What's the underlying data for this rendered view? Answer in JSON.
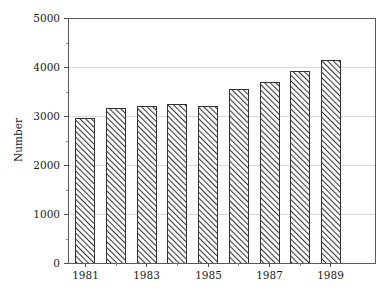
{
  "chart_data": {
    "type": "bar",
    "title": "",
    "xlabel": "",
    "ylabel": "Number",
    "categories": [
      "1981",
      "1982",
      "1983",
      "1984",
      "1985",
      "1986",
      "1987",
      "1988",
      "1989"
    ],
    "values": [
      2960,
      3155,
      3210,
      3245,
      3200,
      3545,
      3700,
      3920,
      4150
    ],
    "series": [
      {
        "name": "Number",
        "values": [
          2960,
          3155,
          3210,
          3245,
          3200,
          3545,
          3700,
          3920,
          4150
        ]
      }
    ],
    "ylim": [
      0,
      5000
    ],
    "y_ticks": [
      0,
      1000,
      2000,
      3000,
      4000,
      5000
    ],
    "y_tick_labels": [
      "0",
      "1000",
      "2000",
      "3000",
      "4000",
      "5000"
    ],
    "y_minor_ticks": [
      500,
      1500,
      2500,
      3500,
      4500
    ],
    "x_tick_labels": [
      "1981",
      "1983",
      "1985",
      "1987",
      "1989"
    ],
    "x_tick_categories": [
      "1981",
      "1983",
      "1985",
      "1987",
      "1989"
    ],
    "grid": "horizontal",
    "legend": "none",
    "bar_fill": "#ffffff",
    "bar_hatch": "diagonal-forward",
    "bar_hatch_color": "#3c3c3c",
    "bar_edge_color": "#333333",
    "grid_color": "#d8d8d8",
    "axis_color": "#5a5a5a",
    "text_color": "#1a1a1a",
    "background": "#ffffff"
  },
  "layout": {
    "plot_left": 68,
    "plot_right": 375,
    "plot_top": 18,
    "plot_bottom": 263,
    "bar_width": 19,
    "bar_gap": 12
  }
}
